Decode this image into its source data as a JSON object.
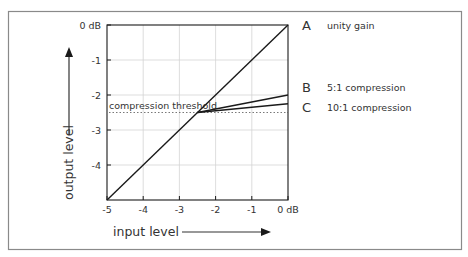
{
  "chart_data": {
    "type": "line",
    "title": "",
    "xlabel": "input level",
    "ylabel": "output level",
    "xlim": [
      -5,
      0
    ],
    "ylim": [
      -5,
      0
    ],
    "grid": true,
    "x_ticks": [
      {
        "value": -5,
        "label": "-5"
      },
      {
        "value": -4,
        "label": "-4"
      },
      {
        "value": -3,
        "label": "-3"
      },
      {
        "value": -2,
        "label": "-2"
      },
      {
        "value": -1,
        "label": "-1"
      },
      {
        "value": 0,
        "label": "0 dB"
      }
    ],
    "y_ticks": [
      {
        "value": 0,
        "label": "0 dB"
      },
      {
        "value": -1,
        "label": "-1"
      },
      {
        "value": -2,
        "label": "-2"
      },
      {
        "value": -3,
        "label": "-3"
      },
      {
        "value": -4,
        "label": "-4"
      }
    ],
    "threshold": {
      "value": -2.5,
      "label": "compression threshold",
      "style": "dotted"
    },
    "series": [
      {
        "key": "A",
        "name": "unity gain",
        "points": [
          [
            -5,
            -5
          ],
          [
            0,
            0
          ]
        ]
      },
      {
        "key": "B",
        "name": "5:1 compression",
        "points": [
          [
            -2.5,
            -2.5
          ],
          [
            0,
            -2.0
          ]
        ]
      },
      {
        "key": "C",
        "name": "10:1 compression",
        "points": [
          [
            -2.5,
            -2.5
          ],
          [
            0,
            -2.25
          ]
        ]
      }
    ],
    "legend_position": "right",
    "colors": {
      "line": "#1a1a1a",
      "grid": "#d4d4d4",
      "frame": "#7a7a7a",
      "text": "#333333"
    }
  }
}
